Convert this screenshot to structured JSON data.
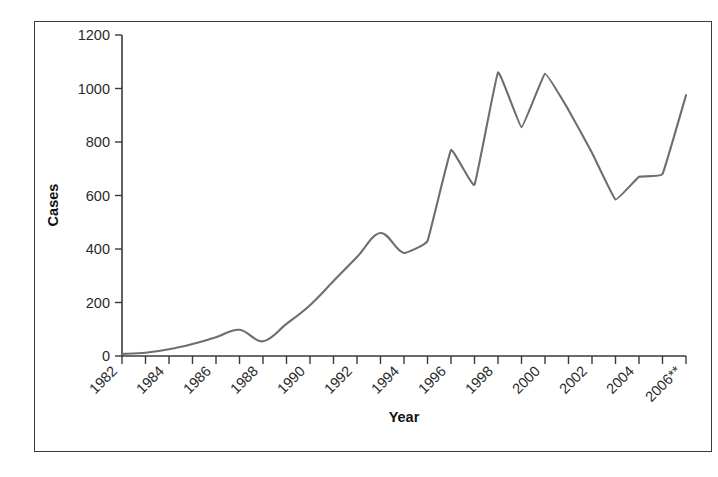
{
  "figure": {
    "background_color": "#ffffff",
    "frame_color": "#3a3a3a",
    "axis_color": "#3a3a3a"
  },
  "chart_data": {
    "type": "line",
    "title": "",
    "xlabel": "Year",
    "ylabel": "Cases",
    "xlim": [
      1982,
      2006
    ],
    "ylim": [
      0,
      1200
    ],
    "ytick_values": [
      0,
      200,
      400,
      600,
      800,
      1000,
      1200
    ],
    "ytick_labels": [
      "0",
      "200",
      "400",
      "600",
      "800",
      "1000",
      "1200"
    ],
    "xtick_values": [
      1982,
      1983,
      1984,
      1985,
      1986,
      1987,
      1988,
      1989,
      1990,
      1991,
      1992,
      1993,
      1994,
      1995,
      1996,
      1997,
      1998,
      1999,
      2000,
      2001,
      2002,
      2003,
      2004,
      2005,
      2006
    ],
    "xtick_labels": [
      "1982",
      "",
      "1984",
      "",
      "1986",
      "",
      "1988",
      "",
      "1990",
      "",
      "1992",
      "",
      "1994",
      "",
      "1996",
      "",
      "1998",
      "",
      "2000",
      "",
      "2002",
      "",
      "2004",
      "",
      "2006**"
    ],
    "grid": false,
    "legend": false,
    "series": [
      {
        "name": "Cases",
        "color": "#6e6e6e",
        "smoothing": "spline-early-linear-late",
        "x": [
          1982,
          1983,
          1984,
          1985,
          1986,
          1987,
          1988,
          1989,
          1990,
          1991,
          1992,
          1993,
          1994,
          1995,
          1996,
          1997,
          1998,
          1999,
          2000,
          2001,
          2002,
          2003,
          2004,
          2005,
          2006
        ],
        "values": [
          8,
          12,
          25,
          45,
          70,
          98,
          55,
          120,
          190,
          280,
          370,
          460,
          385,
          430,
          770,
          640,
          1060,
          855,
          1055,
          920,
          760,
          585,
          670,
          680,
          975
        ]
      }
    ],
    "annotations": [
      "2006 value marked with ** footnote"
    ]
  }
}
